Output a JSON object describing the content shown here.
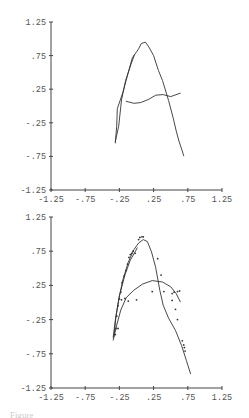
{
  "chart_data": [
    {
      "type": "line",
      "title": "",
      "xlabel": "",
      "ylabel": "",
      "xlim": [
        -1.25,
        1.25
      ],
      "ylim": [
        -1.25,
        1.25
      ],
      "x_ticks": [
        "-1.25",
        "-.75",
        "-.25",
        ".25",
        ".75",
        "1.25"
      ],
      "y_ticks": [
        "1.25",
        ".75",
        ".25",
        "-.25",
        "-.75",
        "-1.25"
      ],
      "grid": false,
      "series": [
        {
          "name": "trajectory-A",
          "points": [
            [
              -0.31,
              -0.55
            ],
            [
              -0.29,
              -0.3
            ],
            [
              -0.28,
              -0.04
            ],
            [
              -0.2,
              0.2
            ],
            [
              -0.12,
              0.5
            ],
            [
              -0.06,
              0.72
            ],
            [
              -0.03,
              0.76
            ],
            [
              0.03,
              0.85
            ],
            [
              0.07,
              0.93
            ],
            [
              0.13,
              0.95
            ],
            [
              0.18,
              0.88
            ],
            [
              0.25,
              0.75
            ],
            [
              0.32,
              0.53
            ],
            [
              0.38,
              0.38
            ],
            [
              0.47,
              0.08
            ],
            [
              0.54,
              -0.19
            ],
            [
              0.58,
              -0.37
            ],
            [
              0.62,
              -0.52
            ],
            [
              0.66,
              -0.64
            ],
            [
              0.69,
              -0.74
            ]
          ]
        },
        {
          "name": "trajectory-B",
          "points": [
            [
              -0.15,
              0.07
            ],
            [
              -0.04,
              0.04
            ],
            [
              0.06,
              0.05
            ],
            [
              0.18,
              0.1
            ],
            [
              0.28,
              0.16
            ],
            [
              0.39,
              0.17
            ],
            [
              0.5,
              0.14
            ],
            [
              0.64,
              0.19
            ]
          ]
        }
      ]
    },
    {
      "type": "scatter",
      "title": "",
      "xlabel": "",
      "ylabel": "",
      "xlim": [
        -1.25,
        1.25
      ],
      "ylim": [
        -1.25,
        1.25
      ],
      "x_ticks": [
        "-1.25",
        "-.75",
        "-.25",
        ".25",
        ".75",
        "1.25"
      ],
      "y_ticks": [
        "1.25",
        ".75",
        ".25",
        "-.25",
        "-.75",
        "-1.25"
      ],
      "grid": false,
      "series": [
        {
          "name": "fit-curve-A",
          "kind": "line",
          "points": [
            [
              -0.34,
              -0.51
            ],
            [
              -0.31,
              -0.26
            ],
            [
              -0.26,
              0.04
            ],
            [
              -0.2,
              0.33
            ],
            [
              -0.12,
              0.59
            ],
            [
              -0.04,
              0.77
            ],
            [
              0.03,
              0.87
            ],
            [
              0.1,
              0.92
            ],
            [
              0.16,
              0.89
            ],
            [
              0.22,
              0.74
            ],
            [
              0.28,
              0.51
            ],
            [
              0.34,
              0.18
            ],
            [
              0.39,
              -0.04
            ],
            [
              0.47,
              -0.23
            ],
            [
              0.57,
              -0.41
            ],
            [
              0.66,
              -0.63
            ],
            [
              0.73,
              -0.85
            ],
            [
              0.79,
              -1.04
            ]
          ]
        },
        {
          "name": "fit-curve-B",
          "kind": "line",
          "points": [
            [
              -0.34,
              -0.55
            ],
            [
              -0.29,
              -0.33
            ],
            [
              -0.23,
              -0.11
            ],
            [
              -0.15,
              0.07
            ],
            [
              -0.04,
              0.18
            ],
            [
              0.09,
              0.27
            ],
            [
              0.23,
              0.32
            ],
            [
              0.38,
              0.3
            ],
            [
              0.5,
              0.23
            ],
            [
              0.58,
              0.13
            ],
            [
              0.64,
              0.01
            ]
          ]
        },
        {
          "name": "observations",
          "kind": "scatter",
          "points": [
            [
              -0.31,
              -0.47
            ],
            [
              -0.3,
              -0.38
            ],
            [
              -0.29,
              -0.2
            ],
            [
              -0.27,
              -0.05
            ],
            [
              -0.25,
              0.05
            ],
            [
              -0.23,
              0.15
            ],
            [
              -0.21,
              0.29
            ],
            [
              -0.18,
              0.39
            ],
            [
              -0.15,
              0.47
            ],
            [
              -0.13,
              0.56
            ],
            [
              -0.11,
              0.66
            ],
            [
              -0.09,
              0.7
            ],
            [
              -0.07,
              0.72
            ],
            [
              -0.05,
              0.75
            ],
            [
              -0.02,
              0.72
            ],
            [
              0.03,
              0.92
            ],
            [
              0.05,
              0.95
            ],
            [
              0.08,
              0.96
            ],
            [
              0.1,
              0.96
            ],
            [
              -0.27,
              -0.38
            ],
            [
              -0.22,
              0.04
            ],
            [
              -0.17,
              0.06
            ],
            [
              -0.12,
              0.02
            ],
            [
              0.0,
              0.04
            ],
            [
              0.23,
              0.16
            ],
            [
              0.31,
              0.64
            ],
            [
              0.36,
              0.4
            ],
            [
              0.4,
              0.16
            ],
            [
              0.52,
              0.13
            ],
            [
              0.55,
              0.15
            ],
            [
              0.6,
              0.16
            ],
            [
              0.63,
              0.17
            ],
            [
              0.52,
              0.03
            ],
            [
              0.57,
              -0.1
            ],
            [
              0.6,
              -0.25
            ],
            [
              0.67,
              -0.56
            ],
            [
              0.69,
              -0.62
            ],
            [
              0.7,
              -0.66
            ],
            [
              0.71,
              -0.71
            ]
          ]
        }
      ]
    }
  ],
  "caption": "Figure"
}
